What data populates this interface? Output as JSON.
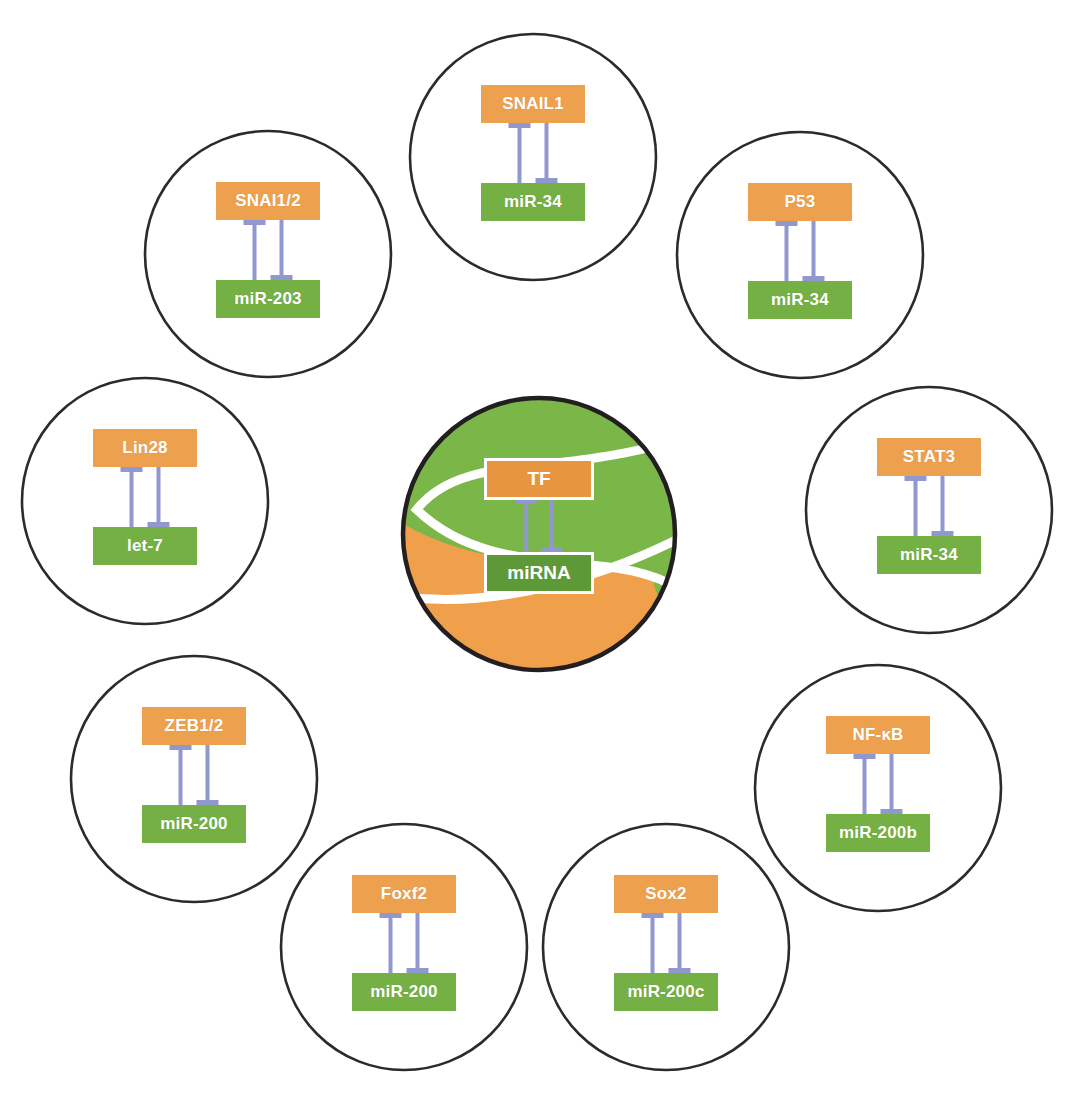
{
  "diagram": {
    "type": "hub-and-spoke-network",
    "colors": {
      "tf_box": "#eda04e",
      "mirna_box": "#74b044",
      "inhibition_arrow": "#9098cf",
      "circle_outline": "#2b2b2b",
      "hub_green": "#7ab648",
      "hub_orange": "#f0a04b",
      "hub_divider": "#ffffff",
      "box_text": "#ffffff"
    },
    "hub": {
      "name": "central-motif",
      "tf_label": "TF",
      "mirna_label": "miRNA",
      "relation": "mutual-inhibition",
      "cx": 539,
      "cy": 534,
      "r": 136
    },
    "nodes": [
      {
        "id": "snail1",
        "tf_label": "SNAIL1",
        "mirna_label": "miR-34",
        "relation": "mutual-inhibition",
        "cx": 533,
        "cy": 157,
        "r": 123,
        "position": "top"
      },
      {
        "id": "p53",
        "tf_label": "P53",
        "mirna_label": "miR-34",
        "relation": "mutual-inhibition",
        "cx": 800,
        "cy": 255,
        "r": 123,
        "position": "top-right"
      },
      {
        "id": "stat3",
        "tf_label": "STAT3",
        "mirna_label": "miR-34",
        "relation": "mutual-inhibition",
        "cx": 929,
        "cy": 510,
        "r": 123,
        "position": "right"
      },
      {
        "id": "nfkb",
        "tf_label": "NF-κB",
        "mirna_label": "miR-200b",
        "relation": "mutual-inhibition",
        "cx": 878,
        "cy": 788,
        "r": 123,
        "position": "bottom-right"
      },
      {
        "id": "sox2",
        "tf_label": "Sox2",
        "mirna_label": "miR-200c",
        "relation": "mutual-inhibition",
        "cx": 666,
        "cy": 947,
        "r": 123,
        "position": "bottom"
      },
      {
        "id": "foxf2",
        "tf_label": "Foxf2",
        "mirna_label": "miR-200",
        "relation": "mutual-inhibition",
        "cx": 404,
        "cy": 947,
        "r": 123,
        "position": "bottom-left"
      },
      {
        "id": "zeb12",
        "tf_label": "ZEB1/2",
        "mirna_label": "miR-200",
        "relation": "mutual-inhibition",
        "cx": 194,
        "cy": 779,
        "r": 123,
        "position": "left-lower"
      },
      {
        "id": "lin28",
        "tf_label": "Lin28",
        "mirna_label": "let-7",
        "relation": "mutual-inhibition",
        "cx": 145,
        "cy": 501,
        "r": 123,
        "position": "left"
      },
      {
        "id": "snai12",
        "tf_label": "SNAI1/2",
        "mirna_label": "miR-203",
        "relation": "mutual-inhibition",
        "cx": 268,
        "cy": 254,
        "r": 123,
        "position": "top-left"
      }
    ]
  }
}
